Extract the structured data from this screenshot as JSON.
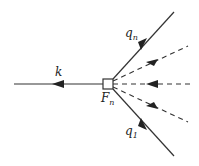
{
  "diagram": {
    "vertex_label": "F",
    "vertex_sub": "n",
    "outgoing_label": "k",
    "top_label": "q",
    "top_sub": "n",
    "bottom_label": "q",
    "bottom_sub": "1",
    "colors": {
      "line": "#333333",
      "background": "#ffffff"
    }
  }
}
